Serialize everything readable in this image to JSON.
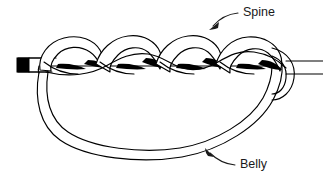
{
  "figure": {
    "canvas": {
      "width": 323,
      "height": 181
    },
    "colors": {
      "background": "#ffffff",
      "stroke": "#000000",
      "shade": "#000000",
      "label": "#1a1a1a"
    }
  },
  "labels": {
    "spine": {
      "text": "Spine",
      "x": 243,
      "y": 13,
      "leader_from": {
        "x": 238,
        "y": 13
      },
      "leader_to": {
        "x": 211,
        "y": 27
      }
    },
    "belly": {
      "text": "Belly",
      "x": 240,
      "y": 165,
      "leader_from": {
        "x": 235,
        "y": 165
      },
      "leader_to": {
        "x": 206,
        "y": 151
      }
    }
  },
  "parts": {
    "cut_end_label": "cut-end",
    "braid_label": "braided-spine",
    "belly_loop_label": "belly-loop",
    "standing_end_label": "standing-end"
  }
}
